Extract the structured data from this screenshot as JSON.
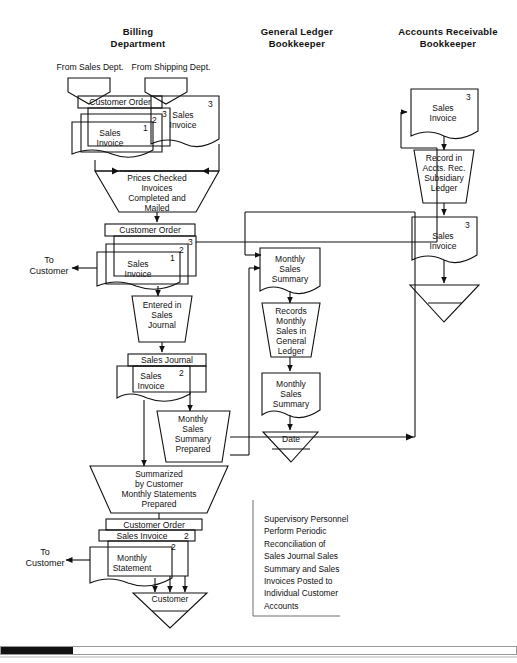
{
  "document": {
    "type": "accounting-system-flowchart",
    "title_present": false
  },
  "columns": [
    {
      "id": "billing",
      "line1": "Billing",
      "line2": "Department"
    },
    {
      "id": "general-ledger",
      "line1": "General Ledger",
      "line2": "Bookkeeper"
    },
    {
      "id": "accounts-receivable",
      "line1": "Accounts Receivable",
      "line2": "Bookkeeper"
    }
  ],
  "inputs": [
    {
      "id": "from-sales-dept",
      "label": "From Sales Dept."
    },
    {
      "id": "from-shipping-dept",
      "label": "From Shipping Dept."
    }
  ],
  "outputs": [
    {
      "id": "to-customer-invoice",
      "line1": "To",
      "line2": "Customer"
    },
    {
      "id": "to-customer-statement",
      "line1": "To",
      "line2": "Customer"
    }
  ],
  "billing_column": {
    "doc_stack_1": {
      "top_label": "Customer Order",
      "copy_numbers": [
        "3",
        "2",
        "1"
      ],
      "front_line1": "Sales",
      "front_line2": "Invoice"
    },
    "doc_shipping": {
      "copy_number": "3",
      "line1": "Sales",
      "line2": "Invoice"
    },
    "process_1": {
      "line1": "Prices Checked",
      "line2": "Invoices",
      "line3": "Completed and",
      "line4": "Mailed"
    },
    "doc_stack_2": {
      "top_label": "Customer Order",
      "copy_numbers": [
        "3",
        "2",
        "1"
      ],
      "front_line1": "Sales",
      "front_line2": "Invoice"
    },
    "process_2": {
      "line1": "Entered in",
      "line2": "Sales",
      "line3": "Journal"
    },
    "doc_stack_3": {
      "top_label": "Sales Journal",
      "copy_numbers": [
        "2"
      ],
      "front_line1": "Sales",
      "front_line2": "Invoice"
    },
    "process_3": {
      "line1": "Monthly",
      "line2": "Sales",
      "line3": "Summary",
      "line4": "Prepared"
    },
    "process_4": {
      "line1": "Summarized",
      "line2": "by Customer",
      "line3": "Monthly Statements",
      "line4": "Prepared"
    },
    "doc_stack_4": {
      "top_label": "Customer Order",
      "second_label": "Sales Invoice",
      "second_number": "2",
      "copy_numbers": [
        "2"
      ],
      "front_line1": "Monthly",
      "front_line2": "Statement"
    },
    "file_1": {
      "label": "Customer"
    }
  },
  "general_ledger_column": {
    "doc_1": {
      "line1": "Monthly",
      "line2": "Sales",
      "line3": "Summary"
    },
    "process_1": {
      "line1": "Records",
      "line2": "Monthly",
      "line3": "Sales in",
      "line4": "General",
      "line5": "Ledger"
    },
    "doc_2": {
      "line1": "Monthly",
      "line2": "Sales",
      "line3": "Summary"
    },
    "file_1": {
      "label": "Date"
    }
  },
  "accounts_receivable_column": {
    "doc_1": {
      "copy_number": "3",
      "line1": "Sales",
      "line2": "Invoice"
    },
    "process_1": {
      "line1": "Record in",
      "line2": "Accts. Rec.",
      "line3": "Subsidiary",
      "line4": "Ledger"
    },
    "doc_2": {
      "copy_number": "3",
      "line1": "Sales",
      "line2": "Invoice"
    },
    "file_1": {
      "label": ""
    }
  },
  "note": {
    "lines": [
      "Supervisory Personnel",
      "Perform Periodic",
      "Reconciliation of",
      "Sales Journal  Sales",
      "Summary  and Sales",
      "Invoices Posted to",
      "Individual Customer",
      "Accounts"
    ]
  },
  "colors": {
    "ink": "#111111",
    "paper": "#ffffff",
    "scan_edge": "#9a9a9a"
  }
}
